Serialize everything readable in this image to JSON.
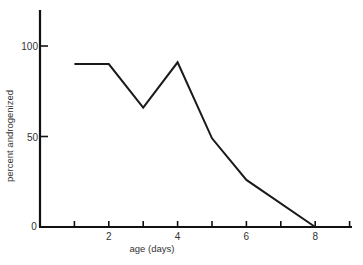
{
  "chart_data": {
    "type": "line",
    "title": "",
    "xlabel": "age (days)",
    "ylabel": "percent androgenized",
    "xlim": [
      0,
      9
    ],
    "ylim": [
      0,
      120
    ],
    "x_ticks": [
      1,
      2,
      3,
      4,
      5,
      6,
      7,
      8,
      9
    ],
    "x_tick_labels": [
      {
        "value": 0,
        "label": "0"
      },
      {
        "value": 2,
        "label": "2"
      },
      {
        "value": 4,
        "label": "4"
      },
      {
        "value": 6,
        "label": "6"
      },
      {
        "value": 8,
        "label": "8"
      }
    ],
    "y_tick_labels": [
      {
        "value": 50,
        "label": "50"
      },
      {
        "value": 100,
        "label": "100"
      }
    ],
    "grid": false,
    "series": [
      {
        "name": "percent androgenized",
        "x": [
          1,
          2,
          3,
          4,
          5,
          6,
          8
        ],
        "values": [
          90,
          90,
          66,
          91,
          49,
          26,
          0
        ],
        "color": "#1a1a1a"
      }
    ]
  }
}
